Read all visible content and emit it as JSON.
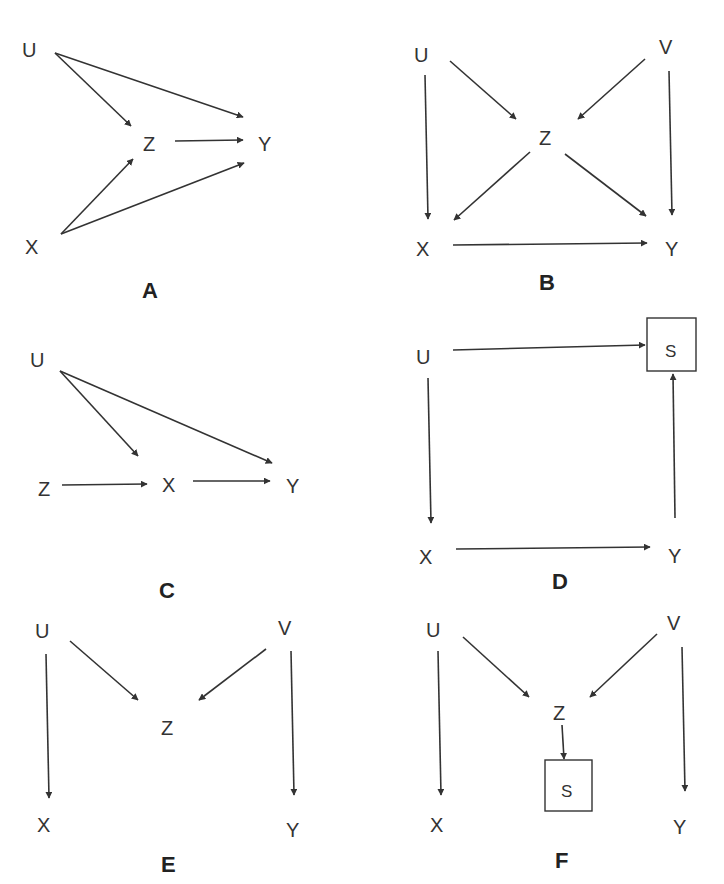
{
  "colors": {
    "ink": "#333333",
    "background": "#ffffff"
  },
  "panels": [
    {
      "id": "A",
      "label": "A",
      "nodes": [
        {
          "id": "U",
          "label": "U"
        },
        {
          "id": "Z",
          "label": "Z"
        },
        {
          "id": "Y",
          "label": "Y"
        },
        {
          "id": "X",
          "label": "X"
        }
      ],
      "edges": [
        [
          "U",
          "Z"
        ],
        [
          "U",
          "Y"
        ],
        [
          "Z",
          "Y"
        ],
        [
          "X",
          "Z"
        ],
        [
          "X",
          "Y"
        ]
      ]
    },
    {
      "id": "B",
      "label": "B",
      "nodes": [
        {
          "id": "U",
          "label": "U"
        },
        {
          "id": "V",
          "label": "V"
        },
        {
          "id": "Z",
          "label": "Z"
        },
        {
          "id": "X",
          "label": "X"
        },
        {
          "id": "Y",
          "label": "Y"
        }
      ],
      "edges": [
        [
          "U",
          "Z"
        ],
        [
          "V",
          "Z"
        ],
        [
          "U",
          "X"
        ],
        [
          "V",
          "Y"
        ],
        [
          "Z",
          "X"
        ],
        [
          "Z",
          "Y"
        ],
        [
          "X",
          "Y"
        ]
      ]
    },
    {
      "id": "C",
      "label": "C",
      "nodes": [
        {
          "id": "U",
          "label": "U"
        },
        {
          "id": "Z",
          "label": "Z"
        },
        {
          "id": "X",
          "label": "X"
        },
        {
          "id": "Y",
          "label": "Y"
        }
      ],
      "edges": [
        [
          "U",
          "X"
        ],
        [
          "U",
          "Y"
        ],
        [
          "Z",
          "X"
        ],
        [
          "X",
          "Y"
        ]
      ]
    },
    {
      "id": "D",
      "label": "D",
      "nodes": [
        {
          "id": "U",
          "label": "U"
        },
        {
          "id": "S",
          "label": "S",
          "boxed": true
        },
        {
          "id": "X",
          "label": "X"
        },
        {
          "id": "Y",
          "label": "Y"
        }
      ],
      "edges": [
        [
          "U",
          "S"
        ],
        [
          "U",
          "X"
        ],
        [
          "X",
          "Y"
        ],
        [
          "Y",
          "S"
        ]
      ]
    },
    {
      "id": "E",
      "label": "E",
      "nodes": [
        {
          "id": "U",
          "label": "U"
        },
        {
          "id": "V",
          "label": "V"
        },
        {
          "id": "Z",
          "label": "Z"
        },
        {
          "id": "X",
          "label": "X"
        },
        {
          "id": "Y",
          "label": "Y"
        }
      ],
      "edges": [
        [
          "U",
          "Z"
        ],
        [
          "V",
          "Z"
        ],
        [
          "U",
          "X"
        ],
        [
          "V",
          "Y"
        ]
      ]
    },
    {
      "id": "F",
      "label": "F",
      "nodes": [
        {
          "id": "U",
          "label": "U"
        },
        {
          "id": "V",
          "label": "V"
        },
        {
          "id": "Z",
          "label": "Z"
        },
        {
          "id": "S",
          "label": "S",
          "boxed": true
        },
        {
          "id": "X",
          "label": "X"
        },
        {
          "id": "Y",
          "label": "Y"
        }
      ],
      "edges": [
        [
          "U",
          "Z"
        ],
        [
          "V",
          "Z"
        ],
        [
          "U",
          "X"
        ],
        [
          "V",
          "Y"
        ],
        [
          "Z",
          "S"
        ]
      ]
    }
  ]
}
